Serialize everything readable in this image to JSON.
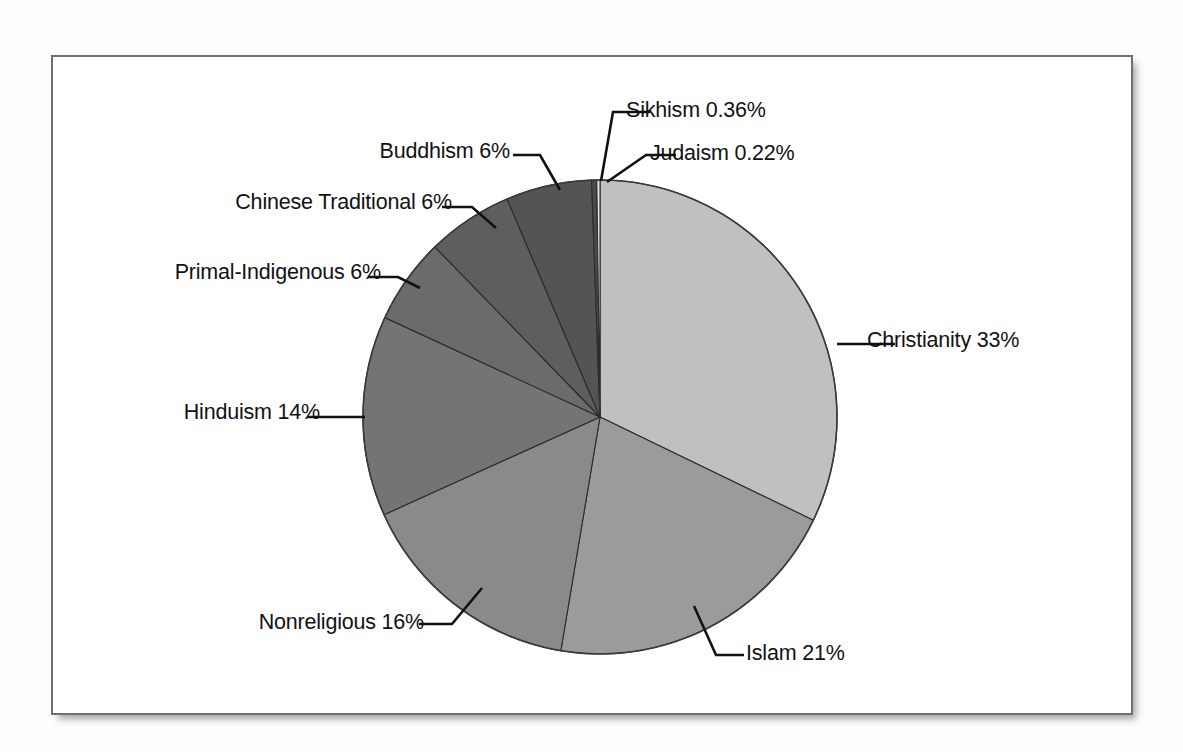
{
  "figure": {
    "frame": {
      "border_color": "#6f6f6f",
      "background": "#ffffff"
    },
    "page_background": "#fdfdfd"
  },
  "chart_data": {
    "type": "pie",
    "title": "",
    "subtitle": "",
    "xlabel": "",
    "ylabel": "",
    "grid": false,
    "legend_position": "none",
    "label_format": "name value%",
    "start_angle_deg": 0,
    "direction": "clockwise",
    "units": "percent",
    "categories": [
      "Christianity",
      "Islam",
      "Nonreligious",
      "Hinduism",
      "Primal-Indigenous",
      "Chinese Traditional",
      "Buddhism",
      "Sikhism",
      "Judaism"
    ],
    "values": [
      33,
      21,
      16,
      14,
      6,
      6,
      6,
      0.36,
      0.22
    ],
    "value_labels": [
      "33%",
      "21%",
      "16%",
      "14%",
      "6%",
      "6%",
      "6%",
      "0.36%",
      "0.22%"
    ],
    "slices": [
      {
        "name": "Christianity",
        "value": 33,
        "value_label": "33%",
        "label": "Christianity 33%",
        "color": "#c0c0c0",
        "label_side": "right"
      },
      {
        "name": "Islam",
        "value": 21,
        "value_label": "21%",
        "label": "Islam 21%",
        "color": "#9b9b9b",
        "label_side": "right"
      },
      {
        "name": "Nonreligious",
        "value": 16,
        "value_label": "16%",
        "label": "Nonreligious 16%",
        "color": "#8a8a8a",
        "label_side": "left"
      },
      {
        "name": "Hinduism",
        "value": 14,
        "value_label": "14%",
        "label": "Hinduism 14%",
        "color": "#747474",
        "label_side": "left"
      },
      {
        "name": "Primal-Indigenous",
        "value": 6,
        "value_label": "6%",
        "label": "Primal-Indigenous 6%",
        "color": "#6b6b6b",
        "label_side": "left"
      },
      {
        "name": "Chinese Traditional",
        "value": 6,
        "value_label": "6%",
        "label": "Chinese Traditional 6%",
        "color": "#5e5e5e",
        "label_side": "left"
      },
      {
        "name": "Buddhism",
        "value": 6,
        "value_label": "6%",
        "label": "Buddhism 6%",
        "color": "#545454",
        "label_side": "left"
      },
      {
        "name": "Sikhism",
        "value": 0.36,
        "value_label": "0.36%",
        "label": "Sikhism 0.36%",
        "color": "#4a4a4a",
        "label_side": "right"
      },
      {
        "name": "Judaism",
        "value": 0.22,
        "value_label": "0.22%",
        "label": "Judaism 0.22%",
        "color": "#e8e8e8",
        "label_side": "right"
      }
    ],
    "total": 102.58
  },
  "labels": {
    "sikhism": "Sikhism 0.36%",
    "judaism": "Judaism 0.22%",
    "buddhism": "Buddhism 6%",
    "chinese_traditional": "Chinese Traditional 6%",
    "primal_indigenous": "Primal-Indigenous 6%",
    "hinduism": "Hinduism 14%",
    "nonreligious": "Nonreligious 16%",
    "islam": "Islam 21%",
    "christianity": "Christianity 33%"
  }
}
